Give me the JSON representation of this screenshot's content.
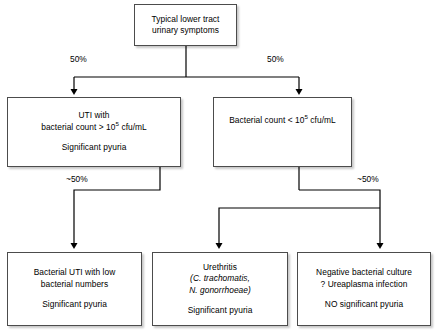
{
  "diagram": {
    "type": "flowchart",
    "colors": {
      "box_border": "#4c4c4c",
      "box_fill": "#ffffff",
      "connector": "#000000",
      "text": "#000000",
      "background": "#ffffff"
    }
  },
  "nodes": {
    "root": {
      "id": "typical-lower-tract-urinary-symptoms",
      "lines": [
        "Typical lower tract",
        "urinary symptoms"
      ]
    },
    "high_count": {
      "id": "uti-with-high-bacterial-count",
      "line1": "UTI with",
      "line2_pre": "bacterial count > 10",
      "line2_sup": "5",
      "line2_post": " cfu/mL",
      "line3": "Significant pyuria"
    },
    "low_count": {
      "id": "bacterial-count-low",
      "line1_pre": "Bacterial count < 10",
      "line1_sup": "5",
      "line1_post": " cfu/mL"
    },
    "bacterial_uti_low": {
      "id": "bacterial-uti-with-low-bacterial-numbers",
      "line1": "Bacterial UTI with low",
      "line2": "bacterial numbers",
      "line3": "Significant pyuria"
    },
    "urethritis": {
      "id": "urethritis",
      "line1": "Urethritis",
      "line2": "(C. trachomatis,",
      "line3": "N. gonorrhoeae)",
      "line4": "Significant pyuria"
    },
    "negative_culture": {
      "id": "negative-bacterial-culture",
      "line1": "Negative bacterial culture",
      "line2": "? Ureaplasma infection",
      "line3": "NO significant pyuria"
    }
  },
  "edges": {
    "root_to_high": "50%",
    "root_to_low": "50%",
    "high_to_bacterial_uti_low": "~50%",
    "low_to_negative": "~50%"
  }
}
